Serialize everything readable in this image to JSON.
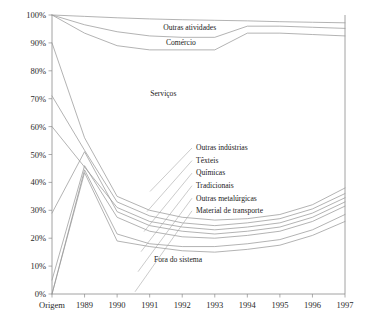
{
  "chart_data": {
    "type": "line",
    "title": "",
    "xlabel": "",
    "ylabel": "",
    "x": [
      "Origem",
      "1989",
      "1990",
      "1991",
      "1992",
      "1993",
      "1994",
      "1995",
      "1996",
      "1997"
    ],
    "ylim": [
      0,
      100
    ],
    "xlim_categories": 10,
    "ytick_labels": [
      "0%",
      "10%",
      "20%",
      "30%",
      "40%",
      "50%",
      "60%",
      "70%",
      "80%",
      "90%",
      "100%"
    ],
    "ytick_values": [
      0,
      10,
      20,
      30,
      40,
      50,
      60,
      70,
      80,
      90,
      100
    ],
    "grid": false,
    "legend_position": "inline-annotations",
    "series": [
      {
        "name": "Outras atividades",
        "label": "Outras atividades",
        "values": [
          100,
          99.5,
          99.0,
          98.6,
          98.3,
          98.1,
          97.9,
          97.6,
          97.4,
          97.2
        ]
      },
      {
        "name": "Comércio",
        "label": "Comércio",
        "values": [
          100,
          96.5,
          94.0,
          92.5,
          92.0,
          92.0,
          96.0,
          96.0,
          95.6,
          95.2
        ]
      },
      {
        "name": "Serviços",
        "label": "Serviços",
        "values": [
          100,
          93.5,
          89.0,
          87.5,
          87.5,
          87.5,
          93.5,
          93.5,
          93.0,
          92.5
        ]
      },
      {
        "name": "Outras indústrias",
        "label": "Outras indústrias",
        "values": [
          90,
          56.0,
          35.0,
          30.0,
          27.5,
          26.5,
          27.0,
          28.5,
          32.0,
          38.0
        ]
      },
      {
        "name": "Têxteis",
        "label": "Têxteis",
        "values": [
          71,
          51.5,
          33.0,
          28.0,
          25.5,
          24.5,
          25.5,
          27.0,
          30.5,
          36.0
        ]
      },
      {
        "name": "Químicas",
        "label": "Químicas",
        "values": [
          60,
          45.5,
          31.0,
          26.0,
          24.0,
          23.0,
          24.0,
          25.5,
          29.0,
          34.5
        ]
      },
      {
        "name": "Tradicionais",
        "label": "Tradicionais",
        "values": [
          29,
          51.0,
          29.5,
          24.5,
          22.5,
          21.5,
          22.5,
          24.0,
          27.5,
          33.0
        ]
      },
      {
        "name": "Outras metalúrgicas",
        "label": "Outras metalúrgicas",
        "values": [
          5,
          46.0,
          27.5,
          22.5,
          20.5,
          20.0,
          21.0,
          22.5,
          26.0,
          31.5
        ]
      },
      {
        "name": "Material de transporte",
        "label": "Material de transporte",
        "values": [
          0,
          44.5,
          21.5,
          18.0,
          17.0,
          17.0,
          18.0,
          19.5,
          23.0,
          28.5
        ]
      },
      {
        "name": "Fora do sistema",
        "label": "Fora do sistema",
        "values": [
          0,
          43.5,
          19.0,
          17.0,
          15.5,
          15.0,
          16.0,
          17.5,
          21.0,
          26.0
        ]
      }
    ],
    "annotations": [
      {
        "text": "Outras atividades",
        "x_frac": 0.47,
        "y_pct": 95.5
      },
      {
        "text": "Comércio",
        "x_frac": 0.44,
        "y_pct": 90.0
      },
      {
        "text": "Serviços",
        "x_frac": 0.38,
        "y_pct": 72.0
      },
      {
        "text": "Fora do sistema",
        "x_frac": 0.43,
        "y_pct": 12.5
      }
    ],
    "leader_labels": [
      {
        "text": "Outras indústrias",
        "y_pct": 52.5
      },
      {
        "text": "Têxteis",
        "y_pct": 48.0
      },
      {
        "text": "Químicas",
        "y_pct": 43.5
      },
      {
        "text": "Tradicionais",
        "y_pct": 39.0
      },
      {
        "text": "Outras metalúrgicas",
        "y_pct": 34.5
      },
      {
        "text": "Material de transporte",
        "y_pct": 30.0
      }
    ]
  }
}
